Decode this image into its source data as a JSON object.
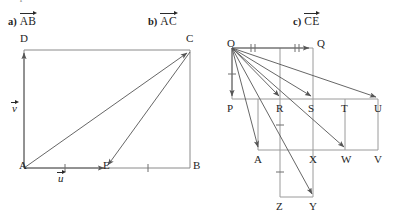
{
  "instruction": {
    "text": "Express each vector in terms of u and v.",
    "visible_fragment": "Express each vector in terms of  u  and  v"
  },
  "parts": [
    {
      "tag": "a)",
      "vector": "AB",
      "x": 8,
      "y": 14
    },
    {
      "tag": "b)",
      "vector": "AC",
      "x": 148,
      "y": 14
    },
    {
      "tag": "c)",
      "vector": "CE",
      "x": 293,
      "y": 14
    }
  ],
  "figures": {
    "left": {
      "name": "parallelogram-rectangle-ABCD",
      "points": [
        {
          "label": "A",
          "x": 24,
          "y": 168
        },
        {
          "label": "B",
          "x": 190,
          "y": 168
        },
        {
          "label": "C",
          "x": 190,
          "y": 50
        },
        {
          "label": "D",
          "x": 24,
          "y": 50
        },
        {
          "label": "E",
          "x": 107,
          "y": 168
        }
      ],
      "vector_labels": [
        {
          "label": "v",
          "x": 14,
          "y": 108
        },
        {
          "label": "u",
          "x": 60,
          "y": 178
        }
      ],
      "tick_positions": [
        {
          "on": "A-E",
          "x": 65
        },
        {
          "on": "E-B",
          "x": 148
        }
      ],
      "arrows": [
        {
          "from": "A",
          "to": "D",
          "name": "arrow-A-to-D"
        },
        {
          "from": "A",
          "to": "C",
          "name": "arrow-A-to-C"
        },
        {
          "from": "C",
          "to": "E",
          "name": "arrow-C-to-E"
        },
        {
          "from": "A",
          "to": "E",
          "name": "arrow-A-to-E"
        }
      ]
    },
    "right": {
      "name": "grid-vector-figure-OQ",
      "points": [
        {
          "label": "O",
          "x": 232,
          "y": 48
        },
        {
          "label": "Q",
          "x": 313,
          "y": 48
        },
        {
          "label": "P",
          "x": 232,
          "y": 99
        },
        {
          "label": "R",
          "x": 280,
          "y": 99
        },
        {
          "label": "S",
          "x": 313,
          "y": 99
        },
        {
          "label": "T",
          "x": 345,
          "y": 99
        },
        {
          "label": "U",
          "x": 378,
          "y": 99
        },
        {
          "label": "A",
          "x": 258,
          "y": 150
        },
        {
          "label": "X",
          "x": 313,
          "y": 150
        },
        {
          "label": "W",
          "x": 345,
          "y": 150
        },
        {
          "label": "V",
          "x": 378,
          "y": 150
        },
        {
          "label": "Z",
          "x": 280,
          "y": 197
        },
        {
          "label": "Y",
          "x": 313,
          "y": 197
        }
      ],
      "arrows": [
        {
          "from": "O",
          "to": "Q",
          "name": "arrow-O-to-Q"
        },
        {
          "from": "O",
          "to": "P",
          "name": "arrow-O-to-P"
        },
        {
          "from": "O",
          "to": "R",
          "name": "arrow-O-to-R"
        },
        {
          "from": "O",
          "to": "S",
          "name": "arrow-O-to-S"
        },
        {
          "from": "O",
          "to": "U",
          "name": "arrow-O-to-U"
        },
        {
          "from": "O",
          "to": "A",
          "name": "arrow-O-to-A"
        },
        {
          "from": "O",
          "to": "W",
          "name": "arrow-O-to-W"
        },
        {
          "from": "O",
          "to": "Y",
          "name": "arrow-O-to-Y"
        }
      ],
      "tick_marks": [
        {
          "name": "double-tick-OQ-first",
          "kind": "double",
          "x": 253,
          "y": 48,
          "orient": "vertical"
        },
        {
          "name": "double-tick-OQ-second",
          "kind": "double",
          "x": 297,
          "y": 48,
          "orient": "vertical"
        },
        {
          "name": "single-tick-OP",
          "kind": "single",
          "x": 232,
          "y": 74,
          "orient": "horizontal"
        },
        {
          "name": "single-tick-RA",
          "kind": "single",
          "x": 280,
          "y": 125,
          "orient": "horizontal"
        },
        {
          "name": "single-tick-ZR",
          "kind": "single",
          "x": 280,
          "y": 172,
          "orient": "horizontal"
        }
      ]
    }
  },
  "colors": {
    "ink": "#2a2a2a",
    "line": "#6f6f6f",
    "background": "#ffffff",
    "faded_text": "#8d8d8d"
  }
}
